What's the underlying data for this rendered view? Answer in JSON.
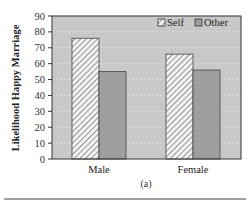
{
  "chart_data": {
    "type": "bar",
    "title": "",
    "xlabel": "",
    "ylabel": "Likelihood Happy Marriage",
    "categories": [
      "Male",
      "Female"
    ],
    "series": [
      {
        "name": "Self",
        "values": [
          76,
          66
        ],
        "pattern": "hatched"
      },
      {
        "name": "Other",
        "values": [
          55,
          56
        ],
        "pattern": "solid-gray"
      }
    ],
    "ylim": [
      0,
      90
    ],
    "yticks": [
      0,
      10,
      20,
      30,
      40,
      50,
      60,
      70,
      80,
      90
    ],
    "grid": true,
    "legend_position": "top-right, inside",
    "caption": "(a)"
  },
  "colors": {
    "plot_background": "#c8c8c8",
    "other_bar": "#9e9e9e",
    "self_bar_background": "#f2f2f2",
    "hatch": "#555555",
    "frame": "#333333",
    "grid": "#e2e2e2"
  },
  "labels": {
    "ylabel": "Likelihood Happy Marriage",
    "caption": "(a)",
    "legend_self": "Self",
    "legend_other": "Other",
    "x_male": "Male",
    "x_female": "Female"
  }
}
